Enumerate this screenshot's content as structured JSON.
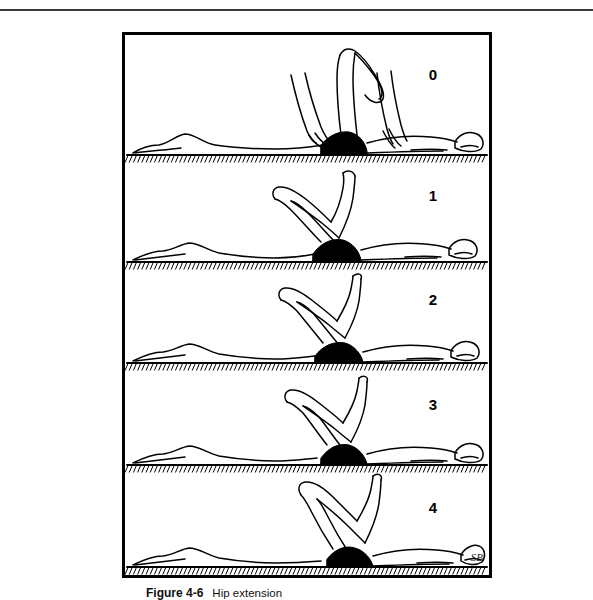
{
  "page": {
    "top_rule": true
  },
  "section": {
    "heading": "Movement VI"
  },
  "figure": {
    "number": "Figure 4-6",
    "caption": "Hip extension",
    "artist_signature": "SB",
    "frame_border_color": "#000000",
    "ink_color": "#000000",
    "shorts_fill_color": "#000000",
    "panels": [
      {
        "rating": "0",
        "description": "Prone, therapist lifts the extended thigh fully off the mat; hip extension graded 0 (no contraction)."
      },
      {
        "rating": "1",
        "description": "Prone with knee flexed, thigh held well clear of the mat; hip extension graded 1 (flicker of contraction)."
      },
      {
        "rating": "2",
        "description": "Prone with knee flexed, thigh raised moderately off the mat; hip extension graded 2 (movement with gravity eliminated)."
      },
      {
        "rating": "3",
        "description": "Prone with knee flexed, thigh raised slightly off the mat; hip extension graded 3 (movement against gravity)."
      },
      {
        "rating": "4",
        "description": "Prone with knee flexed, thigh barely clearing the mat; hip extension graded 4 (movement against gravity plus resistance)."
      }
    ]
  }
}
